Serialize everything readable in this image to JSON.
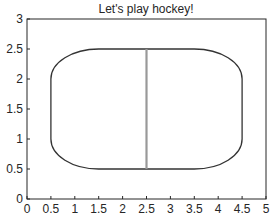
{
  "chart_data": {
    "type": "line",
    "title": "Let's play hockey!",
    "xlabel": "",
    "ylabel": "",
    "xlim": [
      0,
      5
    ],
    "ylim": [
      0,
      3
    ],
    "grid": false,
    "legend": null,
    "xticks": [
      "0",
      "0.5",
      "1",
      "1.5",
      "2",
      "2.5",
      "3",
      "3.5",
      "4",
      "4.5",
      "5"
    ],
    "yticks": [
      "0",
      "0.5",
      "1",
      "1.5",
      "2",
      "2.5",
      "3"
    ],
    "series": [
      {
        "name": "rink-boundary",
        "shape": "rounded-rectangle",
        "x_range": [
          0.5,
          4.5
        ],
        "y_range": [
          0.5,
          2.5
        ],
        "corner_radius_x": 1.0,
        "corner_radius_y": 0.5,
        "color": "#333333"
      },
      {
        "name": "center-line",
        "shape": "vertical-line",
        "x": [
          2.5,
          2.5
        ],
        "y": [
          0.5,
          2.5
        ],
        "color": "#999999"
      }
    ]
  },
  "colors": {
    "axes": "#262626",
    "rink": "#333333",
    "center_line": "#999999",
    "background": "#ffffff"
  }
}
